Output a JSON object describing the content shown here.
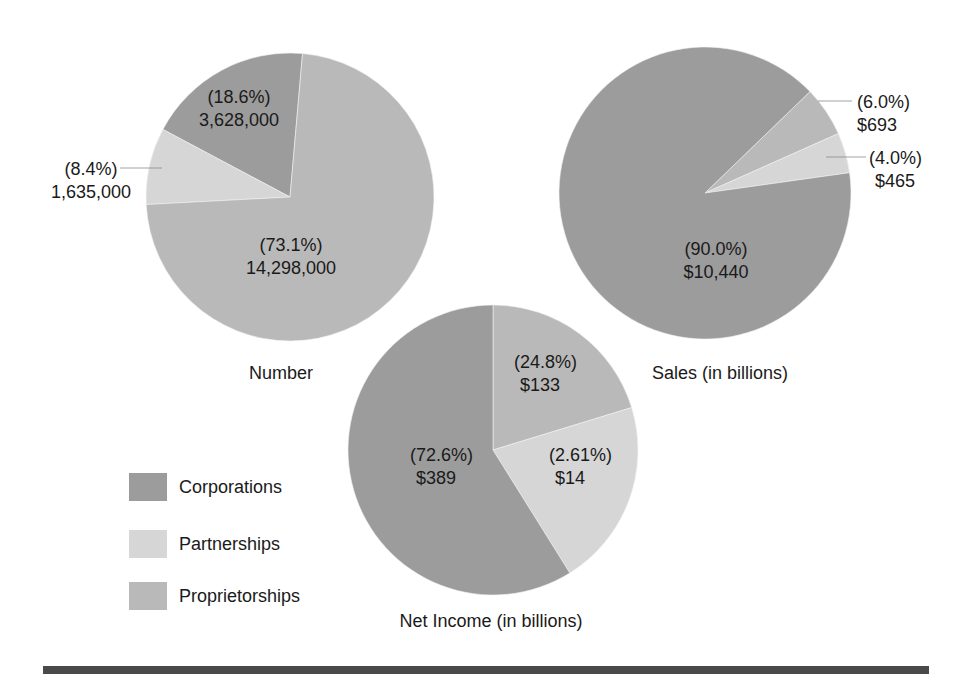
{
  "chart_data": [
    {
      "type": "pie",
      "title": "Number",
      "categories": [
        "Corporations",
        "Partnerships",
        "Proprietorships"
      ],
      "values": [
        3628000,
        1635000,
        14298000
      ],
      "percent_labels": [
        "(18.6%)",
        "(8.4%)",
        "(73.1%)"
      ],
      "value_labels": [
        "3,628,000",
        "1,635,000",
        "14,298,000"
      ]
    },
    {
      "type": "pie",
      "title": "Sales (in billions)",
      "categories": [
        "Corporations",
        "Partnerships",
        "Proprietorships"
      ],
      "values": [
        10440,
        465,
        693
      ],
      "percent_labels": [
        "(90.0%)",
        "(4.0%)",
        "(6.0%)"
      ],
      "value_labels": [
        "$10,440",
        "$465",
        "$693"
      ]
    },
    {
      "type": "pie",
      "title": "Net Income (in billions)",
      "categories": [
        "Corporations",
        "Partnerships",
        "Proprietorships"
      ],
      "values": [
        389,
        14,
        133
      ],
      "percent_labels": [
        "(72.6%)",
        "(2.61%)",
        "(24.8%)"
      ],
      "value_labels": [
        "$389",
        "$14",
        "$133"
      ]
    }
  ],
  "colors": {
    "Corporations": "#9c9c9c",
    "Partnerships": "#d6d6d6",
    "Proprietorships": "#b9b9b9",
    "rule": "#4a4a4a"
  },
  "legend": {
    "items": [
      {
        "label": "Corporations",
        "color": "#9c9c9c"
      },
      {
        "label": "Partnerships",
        "color": "#d6d6d6"
      },
      {
        "label": "Proprietorships",
        "color": "#b9b9b9"
      }
    ]
  },
  "pies": [
    {
      "name": "number",
      "cx": 290,
      "cy": 197,
      "r": 144,
      "slices": [
        {
          "category": "Corporations",
          "start": -85,
          "end": -152
        },
        {
          "category": "Partnerships",
          "start": -152,
          "end": -183
        },
        {
          "category": "Proprietorships",
          "start": -183,
          "end": -445
        }
      ],
      "labels": [
        {
          "lines": [
            "(18.6%)",
            "3,628,000"
          ],
          "x": 239,
          "y": 103,
          "anchor": "middle"
        },
        {
          "lines": [
            "(8.4%)",
            "1,635,000"
          ],
          "x": 91,
          "y": 175,
          "anchor": "middle",
          "leader": [
            120,
            168,
            162,
            168
          ]
        },
        {
          "lines": [
            "(73.1%)",
            "14,298,000"
          ],
          "x": 291,
          "y": 251,
          "anchor": "middle"
        }
      ],
      "title": {
        "text": "Number",
        "x": 281,
        "y": 379
      }
    },
    {
      "name": "sales",
      "cx": 705,
      "cy": 193,
      "r": 146,
      "slices": [
        {
          "category": "Proprietorships",
          "start": -44,
          "end": -24
        },
        {
          "category": "Partnerships",
          "start": -24,
          "end": -8
        },
        {
          "category": "Corporations",
          "start": -8,
          "end": 316
        }
      ],
      "labels": [
        {
          "lines": [
            "(6.0%)",
            "$693"
          ],
          "x": 857,
          "y": 108,
          "anchor": "start",
          "leader": [
            818,
            101,
            852,
            101
          ]
        },
        {
          "lines": [
            "(4.0%)",
            "$465"
          ],
          "x": 869,
          "y": 164,
          "anchor": "start",
          "leader": [
            826,
            157,
            866,
            157
          ],
          "line2_dx": 6
        },
        {
          "lines": [
            "(90.0%)",
            "$10,440"
          ],
          "x": 716,
          "y": 255,
          "anchor": "middle"
        }
      ],
      "title": {
        "text": "Sales (in billions)",
        "x": 720,
        "y": 379
      }
    },
    {
      "name": "net-income",
      "cx": 493,
      "cy": 450,
      "r": 145,
      "slices": [
        {
          "category": "Proprietorships",
          "start": -90,
          "end": -17
        },
        {
          "category": "Partnerships",
          "start": -17,
          "end": 58
        },
        {
          "category": "Corporations",
          "start": 58,
          "end": 270
        }
      ],
      "labels": [
        {
          "lines": [
            "(24.8%)",
            "$133"
          ],
          "x": 514,
          "y": 368,
          "anchor": "start",
          "line2_dx": 6
        },
        {
          "lines": [
            "(72.6%)",
            "$389"
          ],
          "x": 410,
          "y": 461,
          "anchor": "start",
          "line2_dx": 6
        },
        {
          "lines": [
            "(2.61%)",
            "$14"
          ],
          "x": 549,
          "y": 461,
          "anchor": "start",
          "line2_dx": 6
        }
      ],
      "title": {
        "text": "Net Income (in billions)",
        "x": 491,
        "y": 627
      }
    }
  ]
}
